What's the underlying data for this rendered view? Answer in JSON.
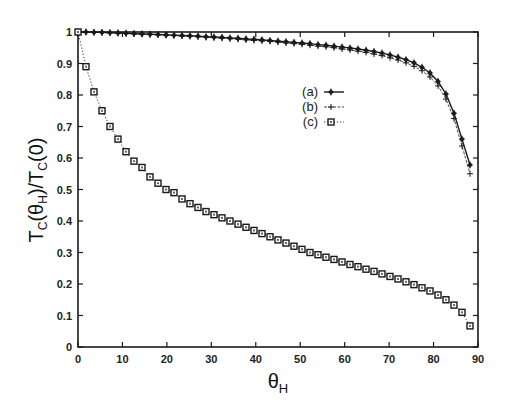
{
  "chart_data": {
    "type": "line",
    "title": "",
    "xlabel": "θ_H",
    "ylabel": "T_C(θ_H)/T_C(0)",
    "xlim": [
      0,
      90
    ],
    "ylim": [
      0,
      1
    ],
    "xticks": [
      0,
      10,
      20,
      30,
      40,
      50,
      60,
      70,
      80,
      90
    ],
    "yticks": [
      0,
      0.1,
      0.2,
      0.3,
      0.4,
      0.5,
      0.6,
      0.7,
      0.8,
      0.9,
      1
    ],
    "grid": false,
    "legend_position": "upper center-right",
    "x": [
      0,
      1.8,
      3.6,
      5.4,
      7.2,
      9.0,
      10.8,
      12.6,
      14.4,
      16.2,
      18.0,
      19.8,
      21.6,
      23.4,
      25.2,
      27.0,
      28.8,
      30.6,
      32.4,
      34.2,
      36.0,
      37.8,
      39.6,
      41.4,
      43.2,
      45.0,
      46.8,
      48.6,
      50.4,
      52.2,
      54.0,
      55.8,
      57.6,
      59.4,
      61.2,
      63.0,
      64.8,
      66.6,
      68.4,
      70.2,
      72.0,
      73.8,
      75.6,
      77.4,
      79.2,
      81.0,
      82.8,
      84.6,
      86.4,
      88.2
    ],
    "series": [
      {
        "name": "(a)",
        "line": "solid",
        "marker": "filled-diamond",
        "values": [
          1.0,
          1.0,
          0.999,
          0.999,
          0.998,
          0.997,
          0.996,
          0.995,
          0.994,
          0.993,
          0.992,
          0.991,
          0.99,
          0.989,
          0.988,
          0.987,
          0.985,
          0.984,
          0.983,
          0.981,
          0.98,
          0.978,
          0.977,
          0.975,
          0.973,
          0.971,
          0.969,
          0.967,
          0.965,
          0.963,
          0.96,
          0.958,
          0.955,
          0.952,
          0.949,
          0.946,
          0.942,
          0.938,
          0.933,
          0.927,
          0.92,
          0.912,
          0.902,
          0.888,
          0.87,
          0.843,
          0.803,
          0.742,
          0.66,
          0.578
        ]
      },
      {
        "name": "(b)",
        "line": "thin-solid",
        "marker": "plus",
        "values": [
          1.0,
          1.0,
          0.999,
          0.998,
          0.997,
          0.996,
          0.995,
          0.994,
          0.993,
          0.992,
          0.991,
          0.99,
          0.989,
          0.987,
          0.986,
          0.985,
          0.983,
          0.982,
          0.98,
          0.979,
          0.977,
          0.975,
          0.973,
          0.972,
          0.97,
          0.968,
          0.965,
          0.963,
          0.961,
          0.958,
          0.955,
          0.953,
          0.95,
          0.946,
          0.943,
          0.939,
          0.935,
          0.93,
          0.925,
          0.918,
          0.911,
          0.902,
          0.891,
          0.877,
          0.857,
          0.829,
          0.787,
          0.725,
          0.638,
          0.55
        ]
      },
      {
        "name": "(c)",
        "line": "dotted",
        "marker": "open-square",
        "values": [
          1.0,
          0.89,
          0.81,
          0.75,
          0.7,
          0.66,
          0.62,
          0.59,
          0.57,
          0.54,
          0.52,
          0.5,
          0.49,
          0.47,
          0.455,
          0.443,
          0.43,
          0.42,
          0.41,
          0.4,
          0.39,
          0.38,
          0.37,
          0.36,
          0.35,
          0.34,
          0.33,
          0.32,
          0.31,
          0.3,
          0.293,
          0.285,
          0.278,
          0.27,
          0.262,
          0.255,
          0.247,
          0.24,
          0.232,
          0.224,
          0.216,
          0.207,
          0.198,
          0.188,
          0.178,
          0.165,
          0.15,
          0.133,
          0.11,
          0.067
        ]
      }
    ]
  },
  "legend": {
    "items": [
      {
        "label": "(a)"
      },
      {
        "label": "(b)"
      },
      {
        "label": "(c)"
      }
    ]
  },
  "axes": {
    "xlabel_main": "θ",
    "xlabel_sub": "H",
    "ylabel_text": "T_C(θ_H)/T_C(0)"
  },
  "colors": {
    "ink": "#1a1a1a",
    "background": "#ffffff"
  }
}
